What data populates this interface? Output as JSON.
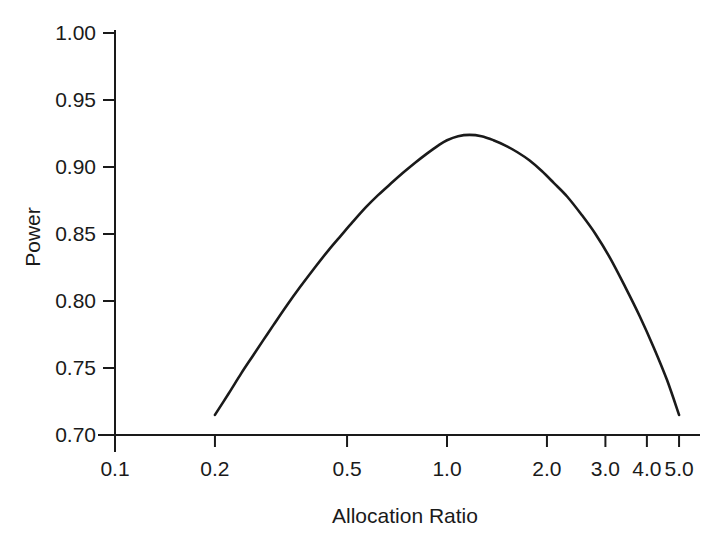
{
  "chart_data": {
    "type": "line",
    "title": "",
    "subtitle": "",
    "xlabel": "Allocation Ratio",
    "ylabel": "Power",
    "xscale": "log",
    "yscale": "linear",
    "xlim": [
      0.1,
      5.0
    ],
    "ylim": [
      0.7,
      1.0
    ],
    "grid": false,
    "legend": null,
    "xticks": [
      0.1,
      0.2,
      0.5,
      1.0,
      2.0,
      3.0,
      4.0,
      5.0
    ],
    "xticklabels": [
      "0.1",
      "0.2",
      "0.5",
      "1.0",
      "2.0",
      "3.0",
      "4.0",
      "5.0"
    ],
    "yticks": [
      0.7,
      0.75,
      0.8,
      0.85,
      0.9,
      0.95,
      1.0
    ],
    "yticklabels": [
      "0.70",
      "0.75",
      "0.80",
      "0.85",
      "0.90",
      "0.95",
      "1.00"
    ],
    "line_color": "#1a1a1a",
    "line_width": 2.6,
    "series": [
      {
        "name": "Power vs Allocation Ratio",
        "x": [
          0.2,
          0.22,
          0.24,
          0.26,
          0.28,
          0.3,
          0.33,
          0.36,
          0.4,
          0.44,
          0.48,
          0.52,
          0.57,
          0.62,
          0.68,
          0.74,
          0.8,
          0.87,
          0.94,
          1.0,
          1.08,
          1.17,
          1.27,
          1.38,
          1.5,
          1.63,
          1.77,
          1.93,
          2.1,
          2.3,
          2.55,
          2.8,
          3.1,
          3.45,
          3.8,
          4.2,
          4.6,
          5.0
        ],
        "y": [
          0.715,
          0.731,
          0.746,
          0.759,
          0.771,
          0.782,
          0.797,
          0.81,
          0.825,
          0.838,
          0.849,
          0.859,
          0.87,
          0.879,
          0.888,
          0.896,
          0.903,
          0.91,
          0.916,
          0.92,
          0.923,
          0.924,
          0.923,
          0.92,
          0.916,
          0.911,
          0.905,
          0.897,
          0.888,
          0.878,
          0.864,
          0.85,
          0.832,
          0.81,
          0.789,
          0.765,
          0.741,
          0.715
        ]
      }
    ],
    "annotations": [],
    "peak": {
      "x": 1.0,
      "y": 0.924
    }
  },
  "axes": {
    "x_axis_label": "Allocation Ratio",
    "y_axis_label": "Power"
  }
}
